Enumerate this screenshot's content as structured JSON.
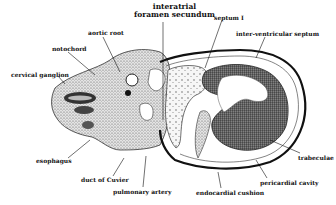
{
  "figure": {
    "type": "anatomical cross-section drawing",
    "labels": {
      "interatrial_foramen": "interatrial\nforamen secundum",
      "septum_1": "septum I",
      "interventricular_septum": "inter-ventricular septum",
      "aortic_root": "aortic root",
      "notochord": "notochord",
      "cervical_ganglion": "cervical ganglion",
      "esophagus": "esophagus",
      "duct_of_cuvier": "duct of Cuvier",
      "pulmonary_artery": "pulmonary artery",
      "endocardial_cushion": "endocardial cushion",
      "pericardial_cavity": "pericardial cavity",
      "trabeculae": "trabeculae"
    }
  }
}
